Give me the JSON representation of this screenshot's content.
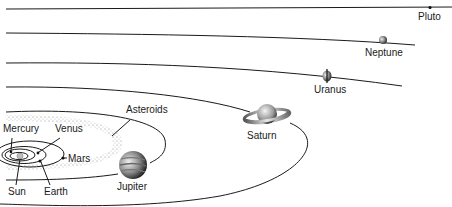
{
  "diagram": {
    "bodies": [
      {
        "id": "sun",
        "label": "Sun"
      },
      {
        "id": "mercury",
        "label": "Mercury"
      },
      {
        "id": "venus",
        "label": "Venus"
      },
      {
        "id": "earth",
        "label": "Earth"
      },
      {
        "id": "mars",
        "label": "Mars"
      },
      {
        "id": "asteroids",
        "label": "Asteroids"
      },
      {
        "id": "jupiter",
        "label": "Jupiter"
      },
      {
        "id": "saturn",
        "label": "Saturn"
      },
      {
        "id": "uranus",
        "label": "Uranus"
      },
      {
        "id": "neptune",
        "label": "Neptune"
      },
      {
        "id": "pluto",
        "label": "Pluto"
      }
    ],
    "colors": {
      "line": "#1a1a1a",
      "background": "#ffffff",
      "sun": "#bdbdbd",
      "asteroid_belt": "#9a9a9a"
    }
  }
}
